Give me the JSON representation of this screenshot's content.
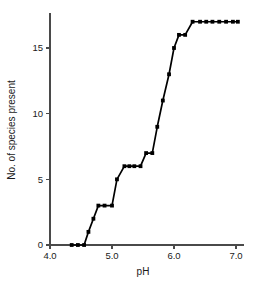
{
  "chart_data": {
    "type": "line",
    "title": "",
    "xlabel": "pH",
    "ylabel": "No. of species present",
    "xlim": [
      4.0,
      7.2
    ],
    "ylim": [
      0,
      17.3
    ],
    "xticks": [
      4.0,
      5.0,
      6.0,
      7.0
    ],
    "xticklabels": [
      "4.0",
      "5.0",
      "6.0",
      "7.0"
    ],
    "yticks": [
      0,
      5,
      10,
      15
    ],
    "yticklabels": [
      "0",
      "5",
      "10",
      "15"
    ],
    "grid": false,
    "legend": null,
    "marker": "filled-square",
    "line_color": "#000000",
    "series": [
      {
        "name": "species richness",
        "x": [
          4.35,
          4.45,
          4.55,
          4.62,
          4.7,
          4.78,
          4.88,
          5.0,
          5.08,
          5.2,
          5.28,
          5.36,
          5.46,
          5.55,
          5.65,
          5.73,
          5.82,
          5.92,
          6.0,
          6.08,
          6.18,
          6.3,
          6.42,
          6.52,
          6.62,
          6.73,
          6.84,
          6.95,
          7.03
        ],
        "y": [
          0,
          0,
          0,
          1,
          2,
          3,
          3,
          3,
          5,
          6,
          6,
          6,
          6,
          7,
          7,
          9,
          11,
          13,
          15,
          16,
          16,
          17,
          17,
          17,
          17,
          17,
          17,
          17,
          17
        ]
      }
    ]
  },
  "axes": {
    "x_title": "pH",
    "y_title": "No. of species present"
  }
}
